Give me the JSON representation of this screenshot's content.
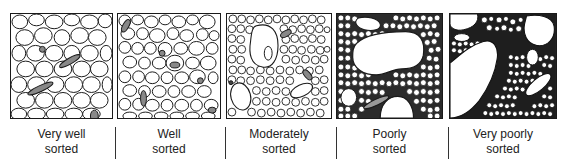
{
  "diagram": {
    "title": "",
    "panels": [
      {
        "id": "very-well",
        "line1": "Very well",
        "line2": "sorted"
      },
      {
        "id": "well",
        "line1": "Well",
        "line2": "sorted"
      },
      {
        "id": "moderately",
        "line1": "Moderately",
        "line2": "sorted"
      },
      {
        "id": "poorly",
        "line1": "Poorly",
        "line2": "sorted"
      },
      {
        "id": "very-poorly",
        "line1": "Very poorly",
        "line2": "sorted"
      }
    ]
  }
}
